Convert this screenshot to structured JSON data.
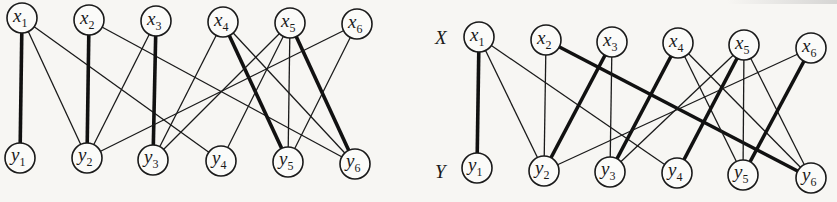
{
  "figure": {
    "side_labels": {
      "top": "X",
      "bottom": "Y",
      "top_pos": [
        435,
        44
      ],
      "bottom_pos": [
        435,
        178
      ]
    },
    "node_radius": 15,
    "graphs": [
      {
        "id": "left",
        "name": "bipartite-graph-left",
        "top_nodes": [
          {
            "id": "x1",
            "base": "x",
            "sub": "1",
            "x": 22,
            "y": 18
          },
          {
            "id": "x2",
            "base": "x",
            "sub": "2",
            "x": 89,
            "y": 20
          },
          {
            "id": "x3",
            "base": "x",
            "sub": "3",
            "x": 156,
            "y": 21
          },
          {
            "id": "x4",
            "base": "x",
            "sub": "4",
            "x": 223,
            "y": 22
          },
          {
            "id": "x5",
            "base": "x",
            "sub": "5",
            "x": 290,
            "y": 23
          },
          {
            "id": "x6",
            "base": "x",
            "sub": "6",
            "x": 357,
            "y": 24
          }
        ],
        "bottom_nodes": [
          {
            "id": "y1",
            "base": "y",
            "sub": "1",
            "x": 20,
            "y": 158
          },
          {
            "id": "y2",
            "base": "y",
            "sub": "2",
            "x": 87,
            "y": 158
          },
          {
            "id": "y3",
            "base": "y",
            "sub": "3",
            "x": 153,
            "y": 160
          },
          {
            "id": "y4",
            "base": "y",
            "sub": "4",
            "x": 221,
            "y": 161
          },
          {
            "id": "y5",
            "base": "y",
            "sub": "5",
            "x": 288,
            "y": 162
          },
          {
            "id": "y6",
            "base": "y",
            "sub": "6",
            "x": 355,
            "y": 164
          }
        ],
        "edges": [
          {
            "from": "x1",
            "to": "y1",
            "matched": true
          },
          {
            "from": "x1",
            "to": "y2",
            "matched": false
          },
          {
            "from": "x1",
            "to": "y4",
            "matched": false
          },
          {
            "from": "x2",
            "to": "y2",
            "matched": true
          },
          {
            "from": "x2",
            "to": "y6",
            "matched": false
          },
          {
            "from": "x3",
            "to": "y2",
            "matched": false
          },
          {
            "from": "x3",
            "to": "y3",
            "matched": true
          },
          {
            "from": "x4",
            "to": "y3",
            "matched": false
          },
          {
            "from": "x4",
            "to": "y5",
            "matched": true
          },
          {
            "from": "x4",
            "to": "y6",
            "matched": false
          },
          {
            "from": "x5",
            "to": "y3",
            "matched": false
          },
          {
            "from": "x5",
            "to": "y4",
            "matched": false
          },
          {
            "from": "x5",
            "to": "y5",
            "matched": false
          },
          {
            "from": "x5",
            "to": "y6",
            "matched": true
          },
          {
            "from": "x6",
            "to": "y2",
            "matched": false
          },
          {
            "from": "x6",
            "to": "y5",
            "matched": false
          }
        ]
      },
      {
        "id": "right",
        "name": "bipartite-graph-right",
        "top_nodes": [
          {
            "id": "x1",
            "base": "x",
            "sub": "1",
            "x": 479,
            "y": 37
          },
          {
            "id": "x2",
            "base": "x",
            "sub": "2",
            "x": 546,
            "y": 40
          },
          {
            "id": "x3",
            "base": "x",
            "sub": "3",
            "x": 612,
            "y": 42
          },
          {
            "id": "x4",
            "base": "x",
            "sub": "4",
            "x": 678,
            "y": 43
          },
          {
            "id": "x5",
            "base": "x",
            "sub": "5",
            "x": 744,
            "y": 45
          },
          {
            "id": "x6",
            "base": "x",
            "sub": "6",
            "x": 811,
            "y": 48
          }
        ],
        "bottom_nodes": [
          {
            "id": "y1",
            "base": "y",
            "sub": "1",
            "x": 477,
            "y": 168
          },
          {
            "id": "y2",
            "base": "y",
            "sub": "2",
            "x": 544,
            "y": 171
          },
          {
            "id": "y3",
            "base": "y",
            "sub": "3",
            "x": 610,
            "y": 172
          },
          {
            "id": "y4",
            "base": "y",
            "sub": "4",
            "x": 677,
            "y": 173
          },
          {
            "id": "y5",
            "base": "y",
            "sub": "5",
            "x": 743,
            "y": 175
          },
          {
            "id": "y6",
            "base": "y",
            "sub": "6",
            "x": 811,
            "y": 178
          }
        ],
        "edges": [
          {
            "from": "x1",
            "to": "y1",
            "matched": true
          },
          {
            "from": "x1",
            "to": "y2",
            "matched": false
          },
          {
            "from": "x1",
            "to": "y4",
            "matched": false
          },
          {
            "from": "x2",
            "to": "y2",
            "matched": false
          },
          {
            "from": "x2",
            "to": "y6",
            "matched": true
          },
          {
            "from": "x3",
            "to": "y2",
            "matched": true
          },
          {
            "from": "x3",
            "to": "y3",
            "matched": false
          },
          {
            "from": "x4",
            "to": "y3",
            "matched": true
          },
          {
            "from": "x4",
            "to": "y5",
            "matched": false
          },
          {
            "from": "x4",
            "to": "y6",
            "matched": false
          },
          {
            "from": "x5",
            "to": "y3",
            "matched": false
          },
          {
            "from": "x5",
            "to": "y4",
            "matched": true
          },
          {
            "from": "x5",
            "to": "y5",
            "matched": false
          },
          {
            "from": "x5",
            "to": "y6",
            "matched": false
          },
          {
            "from": "x6",
            "to": "y2",
            "matched": false
          },
          {
            "from": "x6",
            "to": "y5",
            "matched": true
          }
        ]
      }
    ]
  }
}
